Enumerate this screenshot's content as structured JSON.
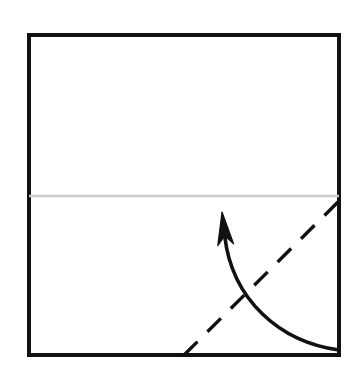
{
  "figure": {
    "kind": "origami-fold-diagram",
    "title": "",
    "caption": "",
    "background_color": "#ffffff",
    "canvas": {
      "width": 358,
      "height": 380
    }
  },
  "paper": {
    "label": "square paper sheet",
    "shape": "square",
    "fill_color": "#ffffff",
    "stroke_color": "#111111",
    "stroke_width": 4,
    "x": 29,
    "y": 35,
    "width": 310,
    "height": 320
  },
  "crease_line": {
    "label": "existing horizontal crease",
    "name": "horizontal-crease-line",
    "style": "solid",
    "color": "#c9c9c9",
    "stroke_width": 2.5,
    "x1": 29,
    "y1": 196,
    "x2": 339,
    "y2": 196
  },
  "fold_line": {
    "label": "valley fold line",
    "name": "diagonal-dashed-fold-line",
    "style": "dashed",
    "color": "#111111",
    "stroke_width": 3.4,
    "dash": "19 14",
    "x1": 184,
    "y1": 355,
    "x2": 338,
    "y2": 202
  },
  "fold_arrow": {
    "label": "fold direction arrow",
    "name": "curved-fold-arrow",
    "color": "#111111",
    "stroke_width": 3.6,
    "tip": {
      "x": 222,
      "y": 212
    },
    "tail": {
      "x": 339,
      "y": 350
    },
    "control_1": {
      "x": 232,
      "y": 300
    },
    "control_2": {
      "x": 280,
      "y": 342
    },
    "head": {
      "length": 33,
      "half_width": 8,
      "notch": 9
    }
  }
}
